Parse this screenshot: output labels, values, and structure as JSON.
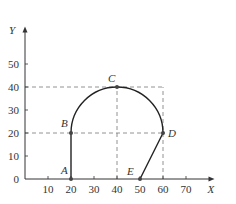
{
  "chart_data": {
    "type": "line",
    "title": "",
    "xlabel": "X",
    "ylabel": "Y",
    "xlim": [
      0,
      75
    ],
    "ylim": [
      0,
      58
    ],
    "x_ticks": [
      10,
      20,
      30,
      40,
      50,
      60,
      70
    ],
    "y_ticks": [
      0,
      10,
      20,
      30,
      40,
      50
    ],
    "origin_label": "0",
    "points": [
      {
        "label": "A",
        "x": 20,
        "y": 0
      },
      {
        "label": "B",
        "x": 20,
        "y": 20
      },
      {
        "label": "C",
        "x": 40,
        "y": 40
      },
      {
        "label": "D",
        "x": 60,
        "y": 20
      },
      {
        "label": "E",
        "x": 50,
        "y": 0
      }
    ],
    "segments": [
      {
        "from": "A",
        "to": "B",
        "kind": "straight"
      },
      {
        "from": "B",
        "to": "C",
        "kind": "arc",
        "center": [
          40,
          20
        ]
      },
      {
        "from": "C",
        "to": "D",
        "kind": "arc",
        "center": [
          40,
          20
        ]
      },
      {
        "from": "D",
        "to": "E",
        "kind": "straight"
      }
    ],
    "guides": [
      {
        "from": [
          0,
          40
        ],
        "to": [
          60,
          40
        ]
      },
      {
        "from": [
          0,
          20
        ],
        "to": [
          60,
          20
        ]
      },
      {
        "from": [
          40,
          0
        ],
        "to": [
          40,
          40
        ]
      },
      {
        "from": [
          60,
          0
        ],
        "to": [
          60,
          40
        ]
      }
    ],
    "grid": false,
    "legend": "none"
  }
}
